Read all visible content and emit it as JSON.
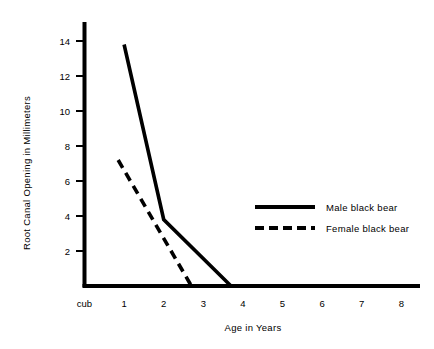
{
  "chart_data": {
    "type": "line",
    "title": "",
    "xlabel": "Age in Years",
    "ylabel": "Root Canal Opening in Millimeters",
    "x_tick_labels": [
      "cub",
      "1",
      "2",
      "3",
      "4",
      "5",
      "6",
      "7",
      "8"
    ],
    "x_tick_values": [
      0,
      1,
      2,
      3,
      4,
      5,
      6,
      7,
      8
    ],
    "y_tick_labels": [
      "2",
      "4",
      "6",
      "8",
      "10",
      "12",
      "14"
    ],
    "y_tick_values": [
      2,
      4,
      6,
      8,
      10,
      12,
      14
    ],
    "xlim": [
      0,
      8.4
    ],
    "ylim": [
      0,
      15
    ],
    "grid": false,
    "legend_position": "center-right",
    "series": [
      {
        "name": "Male black bear",
        "style": "solid",
        "color": "#000000",
        "x": [
          1,
          2,
          3.7
        ],
        "y": [
          13.8,
          3.8,
          0
        ]
      },
      {
        "name": "Female black bear",
        "style": "dashed",
        "color": "#000000",
        "x": [
          0.85,
          2.7
        ],
        "y": [
          7.2,
          0
        ]
      }
    ]
  },
  "axes": {
    "y_axis_title": "Root Canal Opening in Millimeters",
    "x_axis_title": "Age in Years"
  },
  "legend": {
    "entries": [
      {
        "label": "Male black bear",
        "style": "solid"
      },
      {
        "label": "Female black bear",
        "style": "dashed"
      }
    ]
  },
  "ticks": {
    "y": [
      {
        "label": "14",
        "value": 14
      },
      {
        "label": "12",
        "value": 12
      },
      {
        "label": "10",
        "value": 10
      },
      {
        "label": "8",
        "value": 8
      },
      {
        "label": "6",
        "value": 6
      },
      {
        "label": "4",
        "value": 4
      },
      {
        "label": "2",
        "value": 2
      }
    ],
    "x": [
      {
        "label": "cub",
        "value": 0
      },
      {
        "label": "1",
        "value": 1
      },
      {
        "label": "2",
        "value": 2
      },
      {
        "label": "3",
        "value": 3
      },
      {
        "label": "4",
        "value": 4
      },
      {
        "label": "5",
        "value": 5
      },
      {
        "label": "6",
        "value": 6
      },
      {
        "label": "7",
        "value": 7
      },
      {
        "label": "8",
        "value": 8
      }
    ]
  }
}
